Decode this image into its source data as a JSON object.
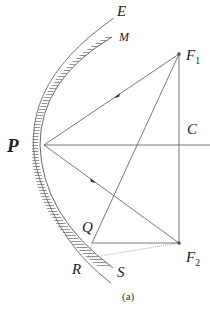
{
  "figure": {
    "caption": "(a)",
    "labels": {
      "E": "E",
      "M": "M",
      "F1": "F",
      "F1_sub": "1",
      "P": "P",
      "C": "C",
      "Q": "Q",
      "R": "R",
      "S": "S",
      "F2": "F",
      "F2_sub": "2"
    },
    "points": {
      "P": [
        44,
        145
      ],
      "F1": [
        179,
        54
      ],
      "C": [
        179,
        145
      ],
      "F2": [
        179,
        243
      ],
      "Q": [
        92,
        243
      ]
    },
    "colors": {
      "line": "#555555",
      "text": "#222222"
    }
  }
}
